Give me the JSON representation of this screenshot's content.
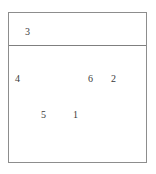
{
  "diagram": {
    "type": "numbered-region-diagram",
    "background_color": "#ffffff",
    "border_color": "#8d8d8d",
    "divider_color": "#7f7f7f",
    "label_color": "#3a3a3a",
    "header": {
      "labels": [
        {
          "text": "3"
        }
      ]
    },
    "body": {
      "labels": [
        {
          "text": "4"
        },
        {
          "text": "6"
        },
        {
          "text": "2"
        },
        {
          "text": "5"
        },
        {
          "text": "1"
        }
      ]
    }
  }
}
